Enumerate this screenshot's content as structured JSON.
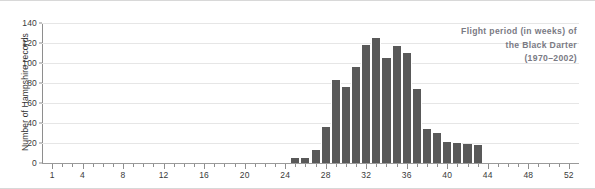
{
  "chart_data": {
    "type": "bar",
    "title": "Flight period (in weeks) of the Black Darter (1970–2002)",
    "title_lines": [
      "Flight period (in weeks) of",
      "the Black Darter",
      "(1970–2002)"
    ],
    "xlabel": "",
    "ylabel": "Number of Hampshire records",
    "xlim": [
      0,
      53
    ],
    "ylim": [
      0,
      140
    ],
    "grid": true,
    "legend": null,
    "y_ticks": [
      0,
      20,
      40,
      60,
      80,
      100,
      120,
      140
    ],
    "x_ticks": [
      1,
      4,
      8,
      12,
      16,
      20,
      24,
      28,
      32,
      36,
      40,
      44,
      48,
      52
    ],
    "x_minor_step": 1,
    "categories": [
      25,
      26,
      27,
      28,
      29,
      30,
      31,
      32,
      33,
      34,
      35,
      36,
      37,
      38,
      39,
      40,
      41,
      42,
      43
    ],
    "values": [
      5,
      5,
      13,
      36,
      83,
      76,
      96,
      118,
      125,
      105,
      117,
      110,
      74,
      34,
      30,
      21,
      20,
      19,
      18
    ],
    "bar_color": "#595959",
    "grid_color": "#e6e6e6",
    "axis_color": "#8e8e8e",
    "title_color": "#7a7a84"
  }
}
